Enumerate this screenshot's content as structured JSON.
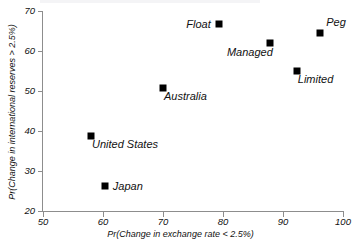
{
  "chart_data": {
    "type": "scatter",
    "title": "",
    "xlabel": "Pr(Change in exchange rate < 2.5%)",
    "ylabel": "Pr(Change in international reserves > 2.5%)",
    "xlim": [
      50,
      100
    ],
    "ylim": [
      20,
      70
    ],
    "xticks": [
      50,
      60,
      70,
      80,
      90,
      100
    ],
    "yticks": [
      20,
      30,
      40,
      50,
      60,
      70
    ],
    "grid": false,
    "legend": "none",
    "marker": "filled-square",
    "marker_color": "#000000",
    "points": [
      {
        "label": "United States",
        "x": 58.0,
        "y": 38.8,
        "label_pos": "below-right"
      },
      {
        "label": "Japan",
        "x": 60.3,
        "y": 26.3,
        "label_pos": "right"
      },
      {
        "label": "Australia",
        "x": 70.0,
        "y": 50.8,
        "label_pos": "below-right"
      },
      {
        "label": "Float",
        "x": 79.3,
        "y": 66.8,
        "label_pos": "left"
      },
      {
        "label": "Managed",
        "x": 87.8,
        "y": 62.0,
        "label_pos": "below-left"
      },
      {
        "label": "Limited",
        "x": 92.3,
        "y": 55.0,
        "label_pos": "below-right"
      },
      {
        "label": "Peg",
        "x": 96.2,
        "y": 64.5,
        "label_pos": "above-right"
      }
    ]
  },
  "axes": {
    "x_tick_labels": [
      "50",
      "60",
      "70",
      "80",
      "90",
      "100"
    ],
    "y_tick_labels": [
      "20",
      "30",
      "40",
      "50",
      "60",
      "70"
    ],
    "x_title": "Pr(Change in exchange rate < 2.5%)",
    "y_title": "Pr(Change in international reserves > 2.5%)"
  }
}
